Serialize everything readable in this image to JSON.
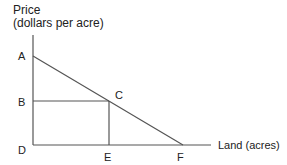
{
  "diagram": {
    "y_axis_title_line1": "Price",
    "y_axis_title_line2": "(dollars per acre)",
    "x_axis_title": "Land (acres)",
    "points": {
      "A": "A",
      "B": "B",
      "C": "C",
      "D": "D",
      "E": "E",
      "F": "F"
    },
    "line_color": "#555555"
  }
}
